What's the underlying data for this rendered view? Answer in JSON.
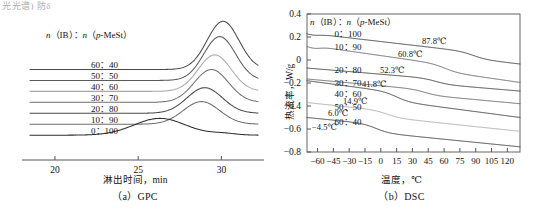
{
  "page": {
    "clipped_text_fragment": "光光谱)  防δ"
  },
  "panels": [
    {
      "id": "gpc",
      "caption": "（a）GPC",
      "legend_header_parts": {
        "n1": "n",
        "ib": "（IB）",
        "colon": "：",
        "n2": "n",
        "mest": "（p-MeSt）"
      },
      "legend_header": "n（IB）：n（p-MeSt）",
      "xlabel": "淋出时间，min",
      "ylabel": "",
      "ratios": [
        "60：40",
        "50：50",
        "40：60",
        "30：70",
        "20：80",
        "10：90",
        "0：100"
      ]
    },
    {
      "id": "dsc",
      "caption": "（b）DSC",
      "legend_header": "n（IB）：n（p-MeSt）",
      "xlabel": "温度，℃",
      "ylabel": "热流率，W/g",
      "ratios": [
        "0：100",
        "10：90",
        "20：80",
        "30：70",
        "40：60",
        "50：50",
        "60：40"
      ],
      "annotations": [
        "87.8℃",
        "60.8℃",
        "52.3℃",
        "41.8℃",
        "14.9℃",
        "6.0℃",
        "-4.5℃"
      ]
    }
  ],
  "colors": {
    "curve_dark": "#4a4a4a",
    "curve_mid": "#6e6e6e",
    "curve_light": "#a8a8a8",
    "axis": "#555555",
    "text": "#111111"
  },
  "chart_data": [
    {
      "type": "line",
      "id": "gpc",
      "title": "（a）GPC",
      "xlabel": "淋出时间，min",
      "ylabel": "",
      "xlim": [
        18.5,
        32.2
      ],
      "xticks": [
        20,
        25,
        30
      ],
      "grid": false,
      "legend_position": "inside-left",
      "legend_title": "n（IB）：n（p-MeSt）",
      "note": "Stacked GPC elution traces, vertically offset; each series is normalized detector response with its own flat baseline.",
      "series": [
        {
          "name": "60：40",
          "baseline": 0.62,
          "peak_x": 30.1,
          "peak_height": 0.33,
          "width": 1.35,
          "color": "#4a4a4a"
        },
        {
          "name": "50：50",
          "baseline": 0.545,
          "peak_x": 29.9,
          "peak_height": 0.3,
          "width": 1.35,
          "color": "#5a5a5a"
        },
        {
          "name": "40：60",
          "baseline": 0.47,
          "peak_x": 29.6,
          "peak_height": 0.25,
          "width": 1.4,
          "color": "#a8a8a8"
        },
        {
          "name": "30：70",
          "baseline": 0.395,
          "peak_x": 29.4,
          "peak_height": 0.225,
          "width": 1.45,
          "color": "#6e6e6e"
        },
        {
          "name": "20：80",
          "baseline": 0.32,
          "peak_x": 29.0,
          "peak_height": 0.175,
          "width": 1.5,
          "color": "#4a4a4a"
        },
        {
          "name": "10：90",
          "baseline": 0.245,
          "peak_x": 28.8,
          "peak_height": 0.155,
          "width": 1.55,
          "color": "#6e6e6e"
        },
        {
          "name": "0：100",
          "baseline": 0.17,
          "peak_x": 26.3,
          "peak_height": 0.115,
          "width": 2.2,
          "color": "#2e2e2e"
        }
      ]
    },
    {
      "type": "line",
      "id": "dsc",
      "title": "（b）DSC",
      "xlabel": "温度，℃",
      "ylabel": "热流率，W/g",
      "xlim": [
        -70,
        132
      ],
      "ylim": [
        -0.8,
        0.4
      ],
      "xticks": [
        -60,
        -45,
        -30,
        -15,
        0,
        15,
        30,
        45,
        60,
        75,
        90,
        105,
        120
      ],
      "yticks": [
        0.4,
        0.2,
        0,
        -0.2,
        -0.4,
        -0.6,
        -0.8
      ],
      "grid": false,
      "legend_position": "inside-upper-left",
      "legend_title": "n（IB）：n（p-MeSt）",
      "note": "DSC heat-flow traces, vertically offset. Each curve shows a glass-transition step; the labelled value is Tg.",
      "series": [
        {
          "name": "0：100",
          "tg": 87.8,
          "y_start": 0.235,
          "y_end": -0.035,
          "step_drop": 0.055,
          "color": "#4a4a4a"
        },
        {
          "name": "10：90",
          "tg": 60.8,
          "y_start": 0.13,
          "y_end": -0.195,
          "step_drop": 0.06,
          "color": "#6e6e6e"
        },
        {
          "name": "20：80",
          "tg": 52.3,
          "y_start": -0.07,
          "y_end": -0.27,
          "step_drop": 0.045,
          "color": "#4a4a4a"
        },
        {
          "name": "30：70",
          "tg": 41.8,
          "y_start": -0.165,
          "y_end": -0.38,
          "step_drop": 0.045,
          "color": "#6e6e6e"
        },
        {
          "name": "40：60",
          "tg": 14.9,
          "y_start": -0.18,
          "y_end": -0.5,
          "step_drop": 0.075,
          "color": "#4a4a4a"
        },
        {
          "name": "50：50",
          "tg": 6.0,
          "y_start": -0.37,
          "y_end": -0.62,
          "step_drop": 0.055,
          "color": "#b0b0b0"
        },
        {
          "name": "60：40",
          "tg": -4.5,
          "y_start": -0.5,
          "y_end": -0.755,
          "step_drop": 0.07,
          "color": "#4a4a4a"
        }
      ]
    }
  ]
}
